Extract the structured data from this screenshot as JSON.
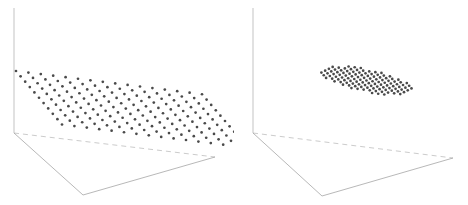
{
  "figure": {
    "title": "",
    "background_color": "#ffffff",
    "width": 468,
    "height": 205,
    "panel_count": 2
  },
  "colors": {
    "background": "#ffffff",
    "dot": "#4a4a4a",
    "axis": "#c9c9c9",
    "floor_edge": "#9a9a9a",
    "floor_hidden_edge": "#b4b4b4"
  },
  "chart_data": {
    "type": "scatter",
    "title": "",
    "subtitle": "",
    "xlabel": "",
    "ylabel": "",
    "zlabel": "",
    "grid": false,
    "legend": null,
    "projection": "3d",
    "axis_ticks": [],
    "tick_labels": [],
    "annotations": [],
    "panels": [
      {
        "name": "left-panel",
        "label": "",
        "description": "wide flat lattice sheet of points spanning the full plot width, tilted in perspective above an empty floor plane",
        "marker": "circle",
        "marker_color": "#4a4a4a",
        "marker_radius_px": 1.35,
        "lattice": {
          "shape": "parallelogram",
          "cols": 16,
          "rows": 11,
          "origin_px": [
            16,
            71
          ],
          "col_step_px": [
            12.4,
            1.55
          ],
          "row_step_px": [
            4.6,
            5.35
          ]
        },
        "point_count": 176,
        "axis": {
          "vertical_line_px": [
            [
              14,
              8
            ],
            [
              14,
              133
            ]
          ],
          "origin_px": [
            14,
            133
          ]
        },
        "floor": {
          "origin_corner_px": [
            14,
            133
          ],
          "front_corner_px": [
            83,
            195
          ],
          "right_corner_px": [
            215,
            157
          ],
          "back_corner_px": [
            14,
            133
          ],
          "solid_edges": [
            [
              [
                14,
                133
              ],
              [
                83,
                195
              ]
            ],
            [
              [
                83,
                195
              ],
              [
                215,
                157
              ]
            ]
          ],
          "dashed_edges": [
            [
              [
                14,
                133
              ],
              [
                215,
                157
              ]
            ]
          ]
        }
      },
      {
        "name": "right-panel",
        "label": "",
        "description": "compact rounded hexagonal cluster of points concentrated near the plot center above an empty floor plane",
        "marker": "circle",
        "marker_color": "#4a4a4a",
        "marker_radius_px": 1.35,
        "lattice": {
          "shape": "rounded-hexagon",
          "cols": 15,
          "rows": 11,
          "origin_px": [
            312,
            62
          ],
          "col_step_px": [
            6.1,
            0.75
          ],
          "row_step_px": [
            2.35,
            2.65
          ],
          "clip_radius_ratio": 1.02
        },
        "point_count": 150,
        "axis": {
          "vertical_line_px": [
            [
              253,
              8
            ],
            [
              253,
              133
            ]
          ],
          "origin_px": [
            253,
            133
          ]
        },
        "floor": {
          "origin_corner_px": [
            253,
            133
          ],
          "front_corner_px": [
            322,
            196
          ],
          "right_corner_px": [
            453,
            158
          ],
          "back_corner_px": [
            253,
            133
          ],
          "solid_edges": [
            [
              [
                253,
                133
              ],
              [
                322,
                196
              ]
            ],
            [
              [
                322,
                196
              ],
              [
                453,
                158
              ]
            ]
          ],
          "dashed_edges": [
            [
              [
                253,
                133
              ],
              [
                453,
                158
              ]
            ]
          ]
        }
      }
    ]
  }
}
